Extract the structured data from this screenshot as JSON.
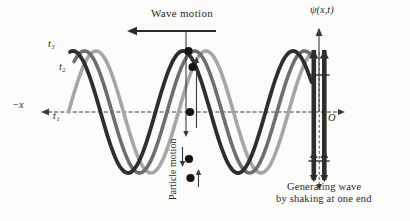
{
  "figure": {
    "labels": {
      "wave_motion": "Wave motion",
      "psi_axis": "ψ(x,t)",
      "neg_x": "−x",
      "origin": "O",
      "t1": "t₁",
      "t2": "t₂",
      "t3": "t₃",
      "particle_motion": "Particle motion",
      "caption_line1": "Generating wave",
      "caption_line2": "by shaking at one end"
    },
    "colors": {
      "t1": "#a6a6a6",
      "t2": "#6e6e6e",
      "t3": "#2e2e2e",
      "ink": "#2b2b2b",
      "axis": "#3a3a3a",
      "dot": "#151515",
      "arrow": "#3a3a3a"
    },
    "geometry": {
      "axis_y": 112,
      "amplitude": 61,
      "wavelength": 110,
      "wave_end_x": 312
    },
    "waves": [
      {
        "id": "t1",
        "label": "t₁",
        "color_key": "t1",
        "crest_x": 96,
        "start_x": 68.5,
        "stroke_width": 3.6
      },
      {
        "id": "t2",
        "label": "t₂",
        "color_key": "t2",
        "crest_x": 84.5,
        "start_x": 74,
        "stroke_width": 3.6
      },
      {
        "id": "t3",
        "label": "t₃",
        "color_key": "t3",
        "crest_x": 73,
        "start_x": 70,
        "stroke_width": 3.8
      }
    ],
    "particles": [
      {
        "x": 188.5,
        "y": 51
      },
      {
        "x": 192.5,
        "y": 67
      },
      {
        "x": 190,
        "y": 112
      },
      {
        "x": 189,
        "y": 159
      },
      {
        "x": 190.5,
        "y": 178
      }
    ],
    "particle_arrows": [
      {
        "x": 186,
        "y1": 32,
        "y2": 137,
        "width": 1.1
      },
      {
        "x": 196.5,
        "y1": 128,
        "y2": 57,
        "width": 1.1
      },
      {
        "x": 182.5,
        "y1": 147,
        "y2": 167,
        "width": 1.1
      },
      {
        "x": 198.5,
        "y1": 187,
        "y2": 169,
        "width": 1.1
      }
    ],
    "wave_motion_arrow": {
      "x1": 216,
      "x2": 127,
      "y": 31
    },
    "x_axis": {
      "x1": 48,
      "x2": 341,
      "y": 112
    },
    "psi_axis": {
      "x": 319,
      "y_top": 29,
      "y_bottom": 112
    },
    "shaker": {
      "bar_left_x": 311.5,
      "bar_right_x": 322,
      "bar_w": 4.6,
      "top_y": 50,
      "bottom_y": 180,
      "tick_ys": [
        75,
        161
      ],
      "center_x": 319.2
    }
  }
}
